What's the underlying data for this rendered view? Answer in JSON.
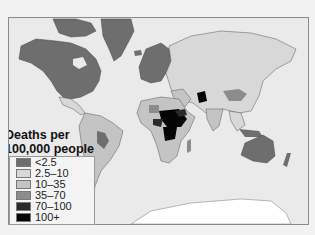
{
  "map": {
    "title_line1": "Deaths per",
    "title_line2": "100,000 people",
    "colors": {
      "ocean": "#eaeaea",
      "lt2_5": "#6e6e6e",
      "2_5to10": "#d8d8d8",
      "10to35": "#bdbdbd",
      "35to70": "#8c8c8c",
      "70to100": "#2a2a2a",
      "100plus": "#050505",
      "antarctica": "#ffffff"
    },
    "legend": [
      {
        "label": "<2.5",
        "color": "#6e6e6e"
      },
      {
        "label": "2.5–10",
        "color": "#d8d8d8"
      },
      {
        "label": "10–35",
        "color": "#c4c4c4"
      },
      {
        "label": "35–70",
        "color": "#8c8c8c"
      },
      {
        "label": "70–100",
        "color": "#2a2a2a"
      },
      {
        "label": "100+",
        "color": "#050505"
      }
    ]
  }
}
